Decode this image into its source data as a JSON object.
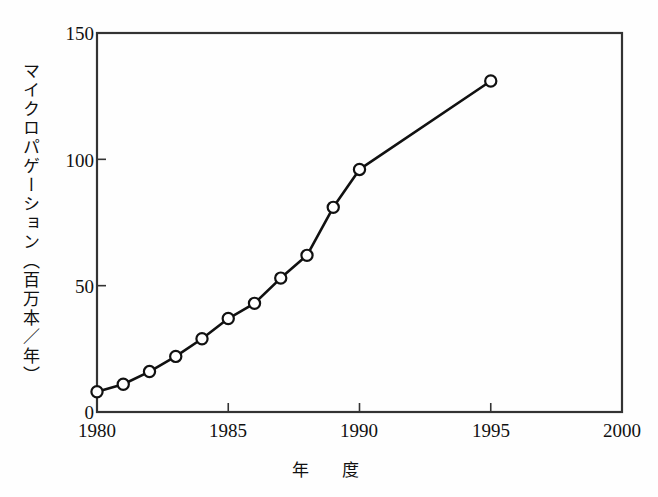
{
  "chart_data": {
    "type": "line",
    "title": "",
    "xlabel": "年　度",
    "ylabel": "マイクロパゲーション（百万本／年）",
    "x": [
      1980,
      1981,
      1982,
      1983,
      1984,
      1985,
      1986,
      1987,
      1988,
      1989,
      1990,
      1995
    ],
    "values": [
      8,
      11,
      16,
      22,
      29,
      37,
      43,
      53,
      62,
      81,
      96,
      131
    ],
    "series": [
      {
        "name": "マイクロパゲーション",
        "values": [
          8,
          11,
          16,
          22,
          29,
          37,
          43,
          53,
          62,
          81,
          96,
          131
        ]
      }
    ],
    "xlim": [
      1980,
      2000
    ],
    "ylim": [
      0,
      150
    ],
    "xticks": [
      "1980",
      "1985",
      "1990",
      "1995",
      "2000"
    ],
    "xtick_values": [
      1980,
      1985,
      1990,
      1995,
      2000
    ],
    "yticks": [
      "0",
      "50",
      "100",
      "150"
    ],
    "ytick_values": [
      0,
      50,
      100,
      150
    ],
    "grid": false,
    "legend": "none",
    "marker": "open-circle",
    "line_color": "#111111",
    "marker_fill": "#ffffff",
    "marker_stroke": "#111111",
    "axis_color": "#333333",
    "background": "#fefefe"
  }
}
